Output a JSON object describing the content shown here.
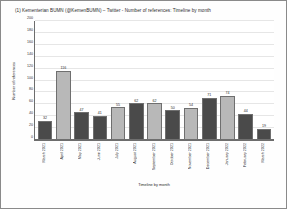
{
  "chart_data": {
    "type": "bar",
    "title": "(1) Kementerian BUMN (@KemenBUMN) – Twitter - Number of references: Timeline by month",
    "xlabel": "Timeline by month",
    "ylabel": "Number of references",
    "ylim": [
      0,
      200
    ],
    "yticks": [
      0,
      20,
      40,
      60,
      80,
      100,
      120,
      140,
      160,
      180,
      200
    ],
    "grid": true,
    "legend": "none",
    "categories": [
      "March 2021",
      "April 2021",
      "May 2021",
      "June 2021",
      "July 2021",
      "August 2021",
      "September 2021",
      "October 2021",
      "November 2021",
      "December 2021",
      "January 2022",
      "February 2022",
      "March 2022"
    ],
    "values": [
      32,
      116,
      47,
      41,
      55,
      62,
      62,
      50,
      54,
      71,
      74,
      44,
      19
    ],
    "bar_colors": [
      "#4a4a4a",
      "#b8b8b8",
      "#4a4a4a",
      "#4a4a4a",
      "#b8b8b8",
      "#4a4a4a",
      "#b8b8b8",
      "#4a4a4a",
      "#b8b8b8",
      "#4a4a4a",
      "#b8b8b8",
      "#4a4a4a",
      "#4a4a4a"
    ]
  }
}
